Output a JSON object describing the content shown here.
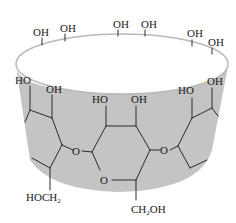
{
  "figure": {
    "colors": {
      "band": "#c4c4c4",
      "rim": "#b8b8b8",
      "bond": "#2a2a2a",
      "text": "#1a1a1a",
      "background": "#ffffff"
    },
    "rim_labels": [
      "OH",
      "OH",
      "OH",
      "OH",
      "OH",
      "OH"
    ],
    "upper_labels": [
      "HO",
      "OH",
      "HO",
      "OH",
      "HO",
      "OH"
    ],
    "ring_oxygens": [
      "O",
      "O",
      "O"
    ],
    "substituents": {
      "left": {
        "main": "HOCH",
        "sub": "2"
      },
      "center": {
        "pre": "CH",
        "sub": "2",
        "post": "OH"
      }
    }
  }
}
